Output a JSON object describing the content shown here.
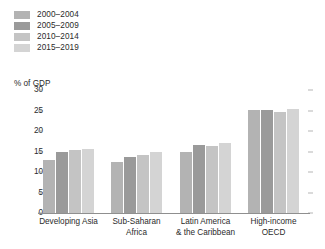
{
  "chart_data": {
    "type": "bar",
    "title": "",
    "subtitle": "",
    "xlabel": "",
    "ylabel": "% of GDP",
    "ylim": [
      0,
      30
    ],
    "ytick_values": [
      30,
      25,
      20,
      15,
      10,
      5,
      0
    ],
    "ytick_labels": [
      "30",
      "25",
      "20",
      "15",
      "10",
      "5",
      "0"
    ],
    "grid": false,
    "legend_position": "top-left",
    "categories": [
      "Developing Asia",
      "Sub-Saharan\nAfrica",
      "Latin America\n& the Caribbean",
      "High-income\nOECD"
    ],
    "series": [
      {
        "name": "2000–2004",
        "color": "#b3b3b3",
        "values": [
          13.0,
          12.5,
          15.0,
          25.2
        ]
      },
      {
        "name": "2005–2009",
        "color": "#9a9a9a",
        "values": [
          14.9,
          13.7,
          16.6,
          25.2
        ]
      },
      {
        "name": "2010–2014",
        "color": "#c4c4c4",
        "values": [
          15.4,
          14.2,
          16.3,
          24.6
        ]
      },
      {
        "name": "2015–2019",
        "color": "#d4d4d4",
        "values": [
          15.6,
          14.9,
          17.1,
          25.4
        ]
      }
    ]
  },
  "legend": {
    "items": [
      {
        "label": "2000–2004",
        "color": "#b3b3b3"
      },
      {
        "label": "2005–2009",
        "color": "#9a9a9a"
      },
      {
        "label": "2010–2014",
        "color": "#c4c4c4"
      },
      {
        "label": "2015–2019",
        "color": "#d4d4d4"
      }
    ]
  },
  "axis": {
    "y_title": "% of GDP"
  },
  "colors": {
    "axis_line": "#8f8f8f",
    "tick_mark": "#9a9a9a",
    "text": "#2b2b2b",
    "background": "#ffffff"
  }
}
